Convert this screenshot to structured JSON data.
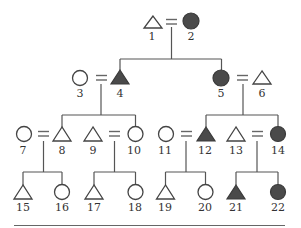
{
  "diagram": {
    "type": "pedigree",
    "legend_shapes": {
      "male": "triangle",
      "female": "circle",
      "affected": "filled",
      "unaffected": "open"
    },
    "individuals": [
      {
        "id": "1",
        "label": "1",
        "sex": "male",
        "affected": false,
        "generation": 1
      },
      {
        "id": "2",
        "label": "2",
        "sex": "female",
        "affected": true,
        "generation": 1
      },
      {
        "id": "3",
        "label": "3",
        "sex": "female",
        "affected": false,
        "generation": 2
      },
      {
        "id": "4",
        "label": "4",
        "sex": "male",
        "affected": true,
        "generation": 2
      },
      {
        "id": "5",
        "label": "5",
        "sex": "female",
        "affected": true,
        "generation": 2
      },
      {
        "id": "6",
        "label": "6",
        "sex": "male",
        "affected": false,
        "generation": 2
      },
      {
        "id": "7",
        "label": "7",
        "sex": "female",
        "affected": false,
        "generation": 3
      },
      {
        "id": "8",
        "label": "8",
        "sex": "male",
        "affected": false,
        "generation": 3
      },
      {
        "id": "9",
        "label": "9",
        "sex": "male",
        "affected": false,
        "generation": 3
      },
      {
        "id": "10",
        "label": "10",
        "sex": "female",
        "affected": false,
        "generation": 3
      },
      {
        "id": "11",
        "label": "11",
        "sex": "female",
        "affected": false,
        "generation": 3
      },
      {
        "id": "12",
        "label": "12",
        "sex": "male",
        "affected": true,
        "generation": 3
      },
      {
        "id": "13",
        "label": "13",
        "sex": "male",
        "affected": false,
        "generation": 3
      },
      {
        "id": "14",
        "label": "14",
        "sex": "female",
        "affected": true,
        "generation": 3
      },
      {
        "id": "15",
        "label": "15",
        "sex": "male",
        "affected": false,
        "generation": 4
      },
      {
        "id": "16",
        "label": "16",
        "sex": "female",
        "affected": false,
        "generation": 4
      },
      {
        "id": "17",
        "label": "17",
        "sex": "male",
        "affected": false,
        "generation": 4
      },
      {
        "id": "18",
        "label": "18",
        "sex": "female",
        "affected": false,
        "generation": 4
      },
      {
        "id": "19",
        "label": "19",
        "sex": "male",
        "affected": false,
        "generation": 4
      },
      {
        "id": "20",
        "label": "20",
        "sex": "female",
        "affected": false,
        "generation": 4
      },
      {
        "id": "21",
        "label": "21",
        "sex": "male",
        "affected": true,
        "generation": 4
      },
      {
        "id": "22",
        "label": "22",
        "sex": "female",
        "affected": true,
        "generation": 4
      }
    ],
    "matings": [
      {
        "partners": [
          "1",
          "2"
        ],
        "children": [
          "4",
          "5"
        ]
      },
      {
        "partners": [
          "3",
          "4"
        ],
        "children": [
          "8",
          "10"
        ]
      },
      {
        "partners": [
          "5",
          "6"
        ],
        "children": [
          "12",
          "14"
        ]
      },
      {
        "partners": [
          "7",
          "8"
        ],
        "children": [
          "15",
          "16"
        ]
      },
      {
        "partners": [
          "9",
          "10"
        ],
        "children": [
          "17",
          "18"
        ]
      },
      {
        "partners": [
          "11",
          "12"
        ],
        "children": [
          "19",
          "20"
        ]
      },
      {
        "partners": [
          "13",
          "14"
        ],
        "children": [
          "21",
          "22"
        ]
      }
    ],
    "colors": {
      "affected_fill": "#4a4a4a",
      "line": "#555555",
      "background": "#ffffff"
    }
  }
}
